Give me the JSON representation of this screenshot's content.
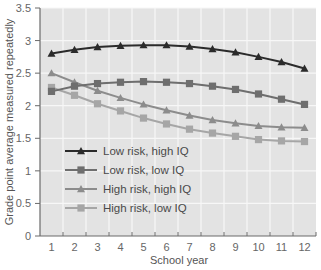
{
  "chart_data": {
    "type": "line",
    "title": "",
    "xlabel": "School year",
    "ylabel": "Grade point average measured repeatedly",
    "x": [
      1,
      2,
      3,
      4,
      5,
      6,
      7,
      8,
      9,
      10,
      11,
      12
    ],
    "x_tick_labels": [
      "1",
      "2",
      "3",
      "4",
      "5",
      "6",
      "7",
      "8",
      "9",
      "10",
      "11",
      "12"
    ],
    "y_tick_labels": [
      "0",
      "0.5",
      "1",
      "1.5",
      "2",
      "2.5",
      "3",
      "3.5"
    ],
    "y_ticks": [
      0,
      0.5,
      1,
      1.5,
      2,
      2.5,
      3,
      3.5
    ],
    "ylim": [
      0,
      3.5
    ],
    "xlim": [
      0.5,
      12.5
    ],
    "grid": true,
    "legend_position": "inside lower-left",
    "series": [
      {
        "name": "Low risk, high IQ",
        "marker": "triangle",
        "color": "#2b2b2b",
        "values": [
          2.8,
          2.86,
          2.9,
          2.92,
          2.93,
          2.93,
          2.91,
          2.87,
          2.82,
          2.75,
          2.67,
          2.57
        ]
      },
      {
        "name": "Low risk, low IQ",
        "marker": "square",
        "color": "#6e6e6e",
        "values": [
          2.22,
          2.3,
          2.34,
          2.36,
          2.37,
          2.36,
          2.34,
          2.3,
          2.25,
          2.18,
          2.1,
          2.02
        ]
      },
      {
        "name": "High risk, high IQ",
        "marker": "triangle",
        "color": "#8c8c8c",
        "values": [
          2.5,
          2.36,
          2.23,
          2.12,
          2.02,
          1.93,
          1.85,
          1.78,
          1.73,
          1.69,
          1.67,
          1.66
        ]
      },
      {
        "name": "High risk, low IQ",
        "marker": "square",
        "color": "#a6a6a6",
        "values": [
          2.28,
          2.16,
          2.03,
          1.92,
          1.81,
          1.72,
          1.64,
          1.58,
          1.53,
          1.48,
          1.46,
          1.45
        ]
      }
    ]
  },
  "colors": {
    "plot_background": "#e3e3e3",
    "gridline": "#f7f7f7",
    "axis": "#6a6a6a"
  }
}
